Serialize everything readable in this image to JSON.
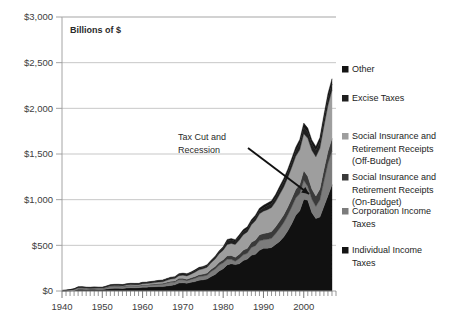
{
  "chart_data": {
    "type": "area",
    "stacked": true,
    "title": "",
    "subtitle": "",
    "axis_title": "Billions of $",
    "xlabel": "",
    "ylabel": "Billions of $",
    "xlim": [
      1940,
      2008
    ],
    "ylim": [
      0,
      3000
    ],
    "ytick_labels": [
      "$0",
      "$500",
      "$1,000",
      "$1,500",
      "$2,000",
      "$2,500",
      "$3,000"
    ],
    "ytick_values": [
      0,
      500,
      1000,
      1500,
      2000,
      2500,
      3000
    ],
    "xtick_labels": [
      "1940",
      "1950",
      "1960",
      "1970",
      "1980",
      "1990",
      "2000"
    ],
    "xtick_values": [
      1940,
      1950,
      1960,
      1970,
      1980,
      1990,
      2000
    ],
    "grid": true,
    "legend_position": "right",
    "annotations": [
      {
        "text_line1": "Tax Cut and",
        "text_line2": "Recession",
        "arrow_from": [
          248,
          148
        ],
        "arrow_to": [
          309,
          194
        ]
      }
    ],
    "x": [
      1940,
      1941,
      1942,
      1943,
      1944,
      1945,
      1946,
      1947,
      1948,
      1949,
      1950,
      1951,
      1952,
      1953,
      1954,
      1955,
      1956,
      1957,
      1958,
      1959,
      1960,
      1961,
      1962,
      1963,
      1964,
      1965,
      1966,
      1967,
      1968,
      1969,
      1970,
      1971,
      1972,
      1973,
      1974,
      1975,
      1976,
      1977,
      1978,
      1979,
      1980,
      1981,
      1982,
      1983,
      1984,
      1985,
      1986,
      1987,
      1988,
      1989,
      1990,
      1991,
      1992,
      1993,
      1994,
      1995,
      1996,
      1997,
      1998,
      1999,
      2000,
      2001,
      2002,
      2003,
      2004,
      2005,
      2006,
      2007
    ],
    "series": [
      {
        "name": "Individual Income Taxes",
        "color": "#111111",
        "values": [
          0.9,
          1.3,
          3.3,
          6.5,
          19.7,
          18.4,
          16.1,
          17.9,
          19.3,
          15.6,
          15.8,
          21.6,
          27.9,
          29.8,
          29.5,
          28.7,
          32.2,
          35.6,
          34.7,
          36.7,
          40.7,
          41.3,
          45.6,
          47.6,
          48.7,
          48.8,
          55.4,
          61.5,
          68.7,
          87.2,
          90.4,
          86.2,
          94.7,
          103.2,
          119.0,
          122.4,
          131.6,
          157.6,
          181.0,
          217.8,
          244.1,
          285.9,
          297.7,
          288.9,
          298.4,
          334.5,
          349.0,
          392.6,
          401.2,
          445.7,
          466.9,
          467.8,
          476.0,
          509.7,
          543.1,
          590.2,
          656.4,
          737.5,
          828.6,
          879.5,
          1004.5,
          994.3,
          858.3,
          793.7,
          809.0,
          927.2,
          1043.9,
          1163.5
        ]
      },
      {
        "name": "Corporation Income Taxes",
        "color": "#7c7c7c",
        "values": [
          1.2,
          2.1,
          4.7,
          9.6,
          14.8,
          16.0,
          11.9,
          8.6,
          9.7,
          11.2,
          10.4,
          14.1,
          21.2,
          21.2,
          21.1,
          17.9,
          20.9,
          21.2,
          20.1,
          17.3,
          21.5,
          21.0,
          20.5,
          21.6,
          23.5,
          25.5,
          30.1,
          34.0,
          28.7,
          36.7,
          32.8,
          26.8,
          32.2,
          36.2,
          38.6,
          40.6,
          41.4,
          54.9,
          60.0,
          65.7,
          64.6,
          61.1,
          49.2,
          37.0,
          56.9,
          61.3,
          63.1,
          83.9,
          94.5,
          103.3,
          93.5,
          98.1,
          100.3,
          117.5,
          140.4,
          157.0,
          171.8,
          182.3,
          188.7,
          184.7,
          207.3,
          151.1,
          148.0,
          131.8,
          189.4,
          278.3,
          353.9,
          370.2
        ]
      },
      {
        "name": "Social Insurance and Retirement Receipts (On-Budget)",
        "color": "#3a3a3a",
        "values": [
          1.2,
          1.5,
          1.8,
          2.2,
          2.5,
          2.8,
          3.0,
          3.2,
          3.4,
          3.4,
          3.5,
          4.0,
          4.5,
          5.0,
          5.2,
          5.3,
          5.6,
          6.0,
          6.2,
          6.4,
          7.0,
          7.4,
          8.0,
          8.6,
          9.2,
          9.5,
          11.0,
          12.0,
          13.0,
          14.5,
          15.5,
          16.5,
          17.5,
          19.0,
          21.0,
          22.0,
          23.0,
          25.0,
          28.0,
          31.0,
          34.0,
          38.0,
          42.0,
          44.0,
          48.0,
          52.0,
          55.0,
          58.0,
          62.0,
          66.0,
          70.0,
          72.0,
          74.0,
          77.0,
          82.0,
          85.0,
          89.0,
          93.0,
          97.0,
          101.0,
          107.0,
          110.0,
          112.0,
          114.0,
          118.0,
          124.0,
          131.0,
          136.0
        ]
      },
      {
        "name": "Social Insurance and Retirement Receipts (Off-Budget)",
        "color": "#9e9e9e",
        "values": [
          0.6,
          0.8,
          1.1,
          1.3,
          1.4,
          1.5,
          1.5,
          1.6,
          1.6,
          1.7,
          1.9,
          3.1,
          3.6,
          3.9,
          4.6,
          5.7,
          6.6,
          7.4,
          8.0,
          8.6,
          10.6,
          11.3,
          12.3,
          14.2,
          16.4,
          16.9,
          20.7,
          24.1,
          26.0,
          29.0,
          34.0,
          36.0,
          40.0,
          48.0,
          54.0,
          58.0,
          64.0,
          72.0,
          81.0,
          94.0,
          104.0,
          123.0,
          132.0,
          139.0,
          155.0,
          169.0,
          180.0,
          190.0,
          212.0,
          230.0,
          244.0,
          253.0,
          263.0,
          272.0,
          290.0,
          304.0,
          321.0,
          340.0,
          360.0,
          380.0,
          404.0,
          416.0,
          424.0,
          430.0,
          446.0,
          474.0,
          504.0,
          531.0
        ]
      },
      {
        "name": "Excise Taxes",
        "color": "#1f1f1f",
        "values": [
          2.0,
          2.6,
          3.4,
          4.1,
          4.8,
          6.3,
          6.7,
          7.2,
          7.4,
          7.5,
          7.6,
          8.6,
          8.9,
          9.9,
          9.9,
          9.1,
          9.9,
          10.5,
          10.6,
          10.6,
          11.7,
          11.9,
          12.5,
          13.2,
          13.7,
          14.6,
          13.1,
          13.7,
          14.1,
          15.2,
          15.7,
          16.6,
          15.5,
          16.3,
          16.8,
          16.6,
          17.0,
          17.5,
          18.4,
          18.7,
          24.3,
          40.8,
          36.3,
          35.3,
          37.4,
          36.0,
          32.9,
          32.5,
          35.2,
          34.4,
          35.3,
          42.4,
          45.6,
          48.1,
          55.2,
          57.5,
          54.0,
          56.9,
          57.7,
          70.4,
          68.9,
          66.2,
          67.0,
          67.5,
          69.9,
          73.1,
          74.0,
          65.1
        ]
      },
      {
        "name": "Other",
        "color": "#141414",
        "values": [
          1.1,
          1.3,
          1.6,
          1.8,
          2.0,
          2.3,
          2.6,
          2.6,
          2.6,
          2.6,
          2.7,
          3.0,
          3.2,
          3.4,
          3.5,
          3.5,
          3.7,
          3.9,
          4.0,
          4.2,
          4.5,
          4.6,
          4.8,
          5.0,
          5.3,
          5.5,
          5.9,
          6.3,
          6.8,
          7.2,
          7.5,
          7.8,
          8.3,
          8.8,
          9.3,
          9.7,
          10.2,
          11.0,
          11.8,
          13.0,
          14.5,
          16.0,
          17.0,
          18.0,
          19.5,
          21.0,
          22.5,
          24.0,
          25.5,
          27.0,
          28.5,
          29.5,
          30.5,
          32.0,
          34.0,
          36.0,
          38.0,
          40.0,
          42.0,
          44.0,
          47.0,
          46.0,
          45.0,
          44.5,
          47.0,
          51.0,
          55.0,
          58.0
        ]
      }
    ]
  },
  "legend": {
    "items": [
      {
        "label": "Other",
        "color": "#141414"
      },
      {
        "label": "Excise Taxes",
        "color": "#1f1f1f"
      },
      {
        "label_line1": "Social Insurance and",
        "label_line2": "Retirement Receipts",
        "label_line3": "(Off-Budget)",
        "color": "#9e9e9e"
      },
      {
        "label_line1": "Social Insurance and",
        "label_line2": "Retirement Receipts",
        "label_line3": "(On-Budget)",
        "color": "#3a3a3a"
      },
      {
        "label_line1": "Corporation Income",
        "label_line2": "Taxes",
        "color": "#7c7c7c"
      },
      {
        "label_line1": "Individual Income",
        "label_line2": "Taxes",
        "color": "#141414"
      }
    ]
  },
  "colors": {
    "background": "#ffffff",
    "gridline": "#b9b9b9",
    "axis": "#9a9a9a",
    "text": "#2a2a2a"
  }
}
